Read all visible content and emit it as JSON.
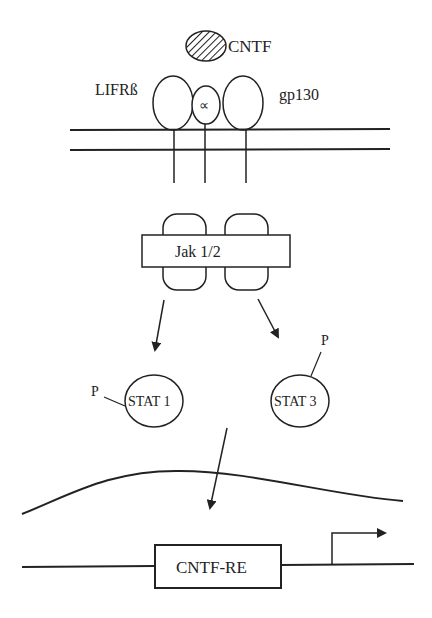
{
  "diagram": {
    "ligand": {
      "label": "CNTF"
    },
    "receptors": {
      "left": {
        "label": "LIFRß"
      },
      "middle": {
        "label": "∝"
      },
      "right": {
        "label": "gp130"
      }
    },
    "kinase": {
      "label": "Jak 1/2"
    },
    "stat_left": {
      "label": "STAT 1",
      "phospho": "P"
    },
    "stat_right": {
      "label": "STAT 3",
      "phospho": "P"
    },
    "response_element": {
      "label": "CNTF-RE"
    },
    "colors": {
      "stroke": "#222222",
      "background": "#ffffff"
    }
  }
}
